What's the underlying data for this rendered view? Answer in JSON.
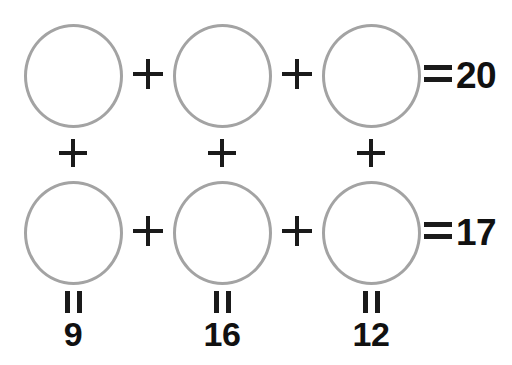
{
  "puzzle": {
    "type": "arithmetic-grid-puzzle",
    "background_color": "#ffffff",
    "circle_stroke_color": "#a3a3a3",
    "text_color": "#111111",
    "operator_color": "#1a1a1a",
    "grid": {
      "rows": 2,
      "columns": 3,
      "cells": [
        {
          "row": 0,
          "col": 0,
          "shape": "circle",
          "value": ""
        },
        {
          "row": 0,
          "col": 1,
          "shape": "circle",
          "value": ""
        },
        {
          "row": 0,
          "col": 2,
          "shape": "circle",
          "value": ""
        },
        {
          "row": 1,
          "col": 0,
          "shape": "circle",
          "value": ""
        },
        {
          "row": 1,
          "col": 1,
          "shape": "circle",
          "value": ""
        },
        {
          "row": 1,
          "col": 2,
          "shape": "circle",
          "value": ""
        }
      ]
    },
    "operators": {
      "plus": "+",
      "equals": "="
    },
    "row_sums": [
      {
        "row": 0,
        "equals_label": "=",
        "value": "20"
      },
      {
        "row": 1,
        "equals_label": "=",
        "value": "17"
      }
    ],
    "column_sums": [
      {
        "col": 0,
        "equals_label": "=",
        "value": "9"
      },
      {
        "col": 1,
        "equals_label": "=",
        "value": "16"
      },
      {
        "col": 2,
        "equals_label": "=",
        "value": "12"
      }
    ]
  }
}
